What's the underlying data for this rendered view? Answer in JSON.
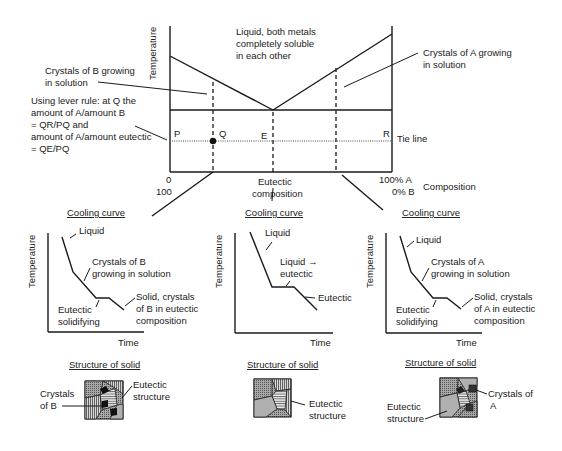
{
  "main_diagram": {
    "y_axis_label": "Temperature",
    "x_axis_label": "Composition",
    "x_left_top": "0",
    "x_left_bottom": "100",
    "x_right_top": "100% A",
    "x_right_bottom": "0% B",
    "liquid_region_label": [
      "Liquid, both metals",
      "completely soluble",
      "in each other"
    ],
    "crystals_b_label": [
      "Crystals of B growing",
      "in solution"
    ],
    "crystals_a_label": [
      "Crystals of A growing",
      "in solution"
    ],
    "lever_rule_label": [
      "Using lever rule: at Q the",
      "amount of A/amount B",
      "= QR/PQ and",
      "amount of A/amount eutectic",
      "= QE/PQ"
    ],
    "point_p": "P",
    "point_q": "Q",
    "point_e": "E",
    "point_r": "R",
    "tie_line_label": "Tie line",
    "eutectic_composition_label": [
      "Eutectic",
      "composition"
    ]
  },
  "cooling_curves": [
    {
      "title": "Cooling curve",
      "y_axis_label": "Temperature",
      "x_axis_label": "Time",
      "labels": {
        "liquid": "Liquid",
        "growing": [
          "Crystals of B",
          "growing in solution"
        ],
        "solidifying": [
          "Eutectic",
          "solidifying"
        ],
        "solid": [
          "Solid, crystals",
          "of B in eutectic",
          "composition"
        ]
      }
    },
    {
      "title": "Cooling curve",
      "y_axis_label": "Temperature",
      "x_axis_label": "Time",
      "labels": {
        "liquid": "Liquid",
        "transition": [
          "Liquid →",
          "eutectic"
        ],
        "eutectic": "Eutectic"
      }
    },
    {
      "title": "Cooling curve",
      "y_axis_label": "Temperature",
      "x_axis_label": "Time",
      "labels": {
        "liquid": "Liquid",
        "growing": [
          "Crystals of A",
          "growing in solution"
        ],
        "solidifying": [
          "Eutectic",
          "solidifying"
        ],
        "solid": [
          "Solid, crystals",
          "of A in eutectic",
          "composition"
        ]
      }
    }
  ],
  "structures": [
    {
      "title": "Structure of solid",
      "labels": {
        "crystals": [
          "Crystals",
          "of B"
        ],
        "eutectic": [
          "Eutectic",
          "structure"
        ]
      }
    },
    {
      "title": "Structure of solid",
      "labels": {
        "eutectic": [
          "Eutectic",
          "structure"
        ]
      }
    },
    {
      "title": "Structure of solid",
      "labels": {
        "crystals": [
          "Crystals of",
          "A"
        ],
        "eutectic": [
          "Eutectic",
          "structure"
        ]
      }
    }
  ]
}
